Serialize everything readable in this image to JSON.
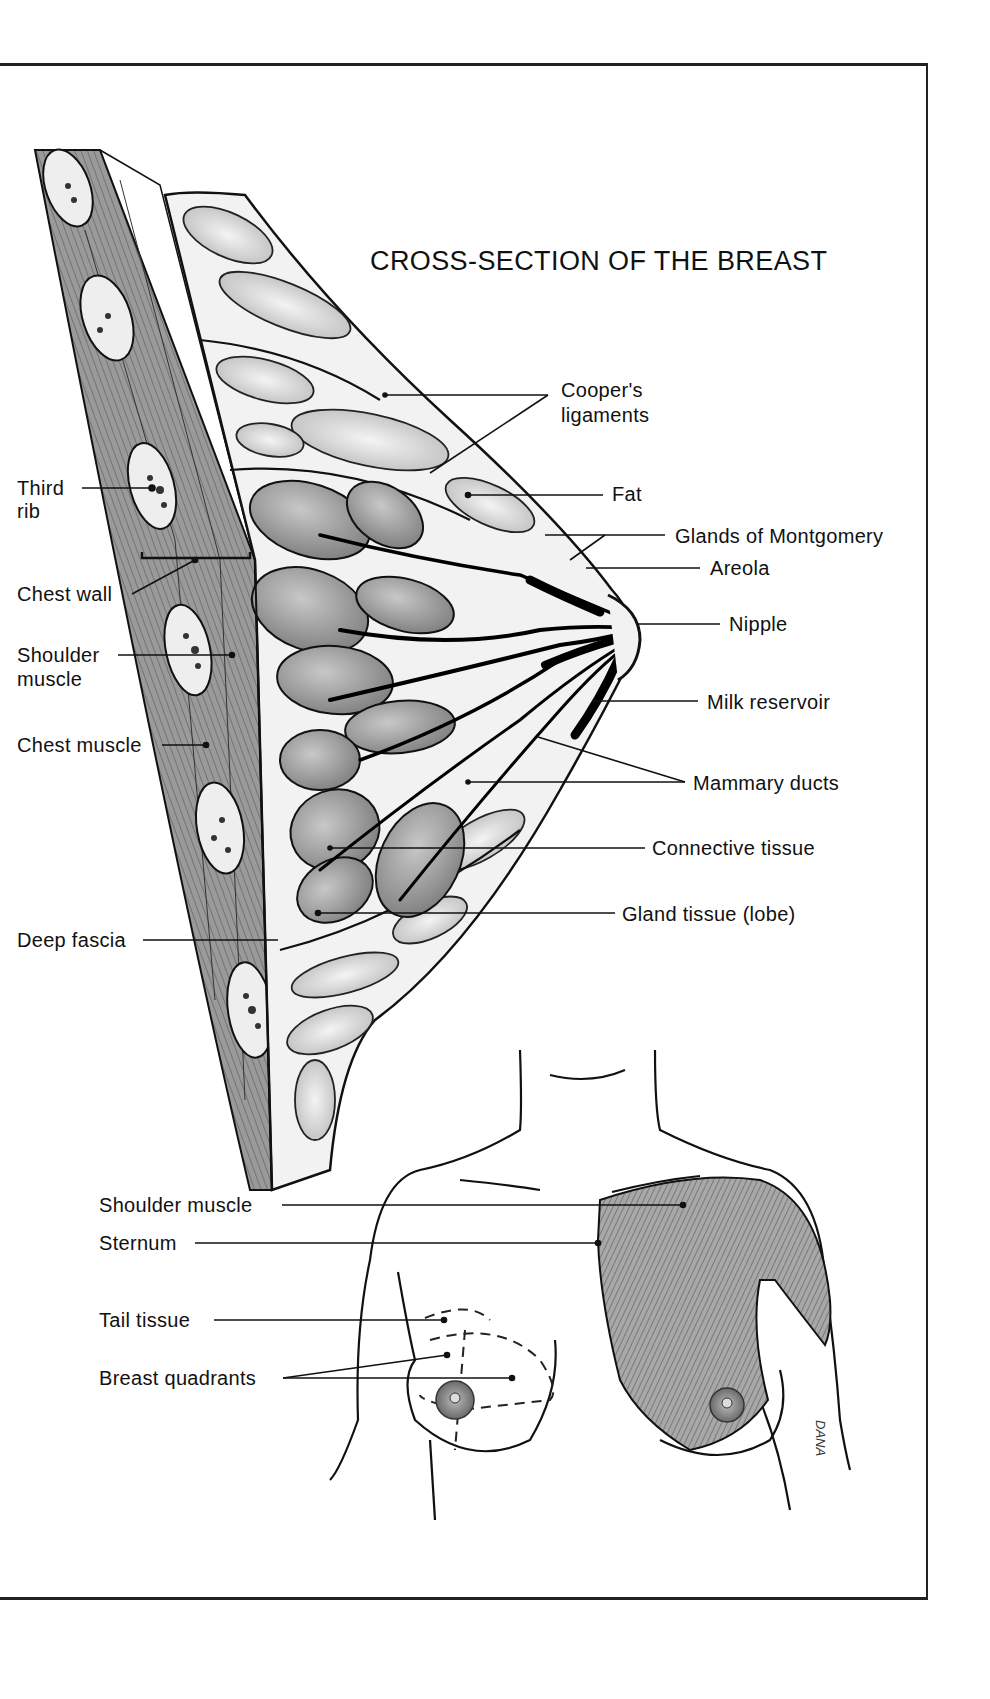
{
  "diagram": {
    "title": "CROSS-SECTION OF THE BREAST",
    "artist_signature": "DANA",
    "cross_section_labels": {
      "coopers_ligaments_line1": "Cooper's",
      "coopers_ligaments_line2": "ligaments",
      "fat": "Fat",
      "glands_of_montgomery": "Glands of Montgomery",
      "areola": "Areola",
      "nipple": "Nipple",
      "milk_reservoir": "Milk reservoir",
      "mammary_ducts": "Mammary ducts",
      "connective_tissue": "Connective tissue",
      "gland_tissue": "Gland tissue (lobe)",
      "third_rib_line1": "Third",
      "third_rib_line2": "rib",
      "chest_wall": "Chest wall",
      "shoulder_muscle_line1": "Shoulder",
      "shoulder_muscle_line2": "muscle",
      "chest_muscle": "Chest muscle",
      "deep_fascia": "Deep fascia"
    },
    "torso_labels": {
      "shoulder_muscle": "Shoulder muscle",
      "sternum": "Sternum",
      "tail_tissue": "Tail tissue",
      "breast_quadrants": "Breast quadrants"
    },
    "colors": {
      "ink": "#111111",
      "muscle_gray": "#8a8a8a",
      "gland_gray": "#9a9a9a",
      "fat_light": "#dedede",
      "paper": "#ffffff"
    }
  }
}
